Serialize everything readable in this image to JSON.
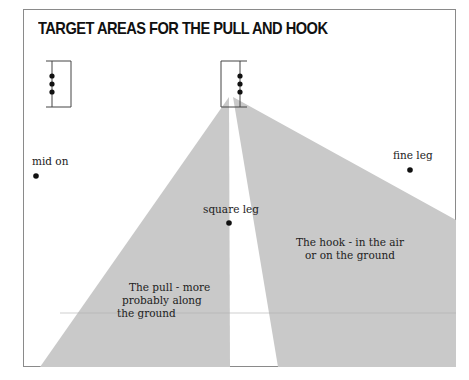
{
  "title": "TARGET AREAS FOR THE PULL AND HOOK",
  "fielders": [
    {
      "label": "mid on",
      "x": 36,
      "y": 176
    },
    {
      "label": "fine leg",
      "x": 410,
      "y": 170
    },
    {
      "label": "square leg",
      "x": 229,
      "y": 223
    }
  ],
  "zones": {
    "pull": {
      "line1": "The pull - more",
      "line2": "probably along",
      "line3": "the ground"
    },
    "hook": {
      "line1": "The hook - in the air",
      "line2": "or on the ground"
    }
  },
  "colors": {
    "zone_fill": "#c9c9c9",
    "frame": "#8a8a8a",
    "ink": "#111111"
  },
  "wickets": [
    "bowler-end-wicket",
    "batsman-end-wicket"
  ]
}
